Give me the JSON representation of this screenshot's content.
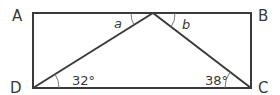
{
  "diagram": {
    "type": "geometry",
    "shape": "rectangle ABCD with point on AB joined to D and C",
    "vertices": {
      "A": {
        "label": "A",
        "x": 33,
        "y": 13
      },
      "B": {
        "label": "B",
        "x": 251,
        "y": 13
      },
      "C": {
        "label": "C",
        "x": 251,
        "y": 88
      },
      "D": {
        "label": "D",
        "x": 33,
        "y": 88
      },
      "P": {
        "label": "",
        "x": 153,
        "y": 13
      }
    },
    "angles": {
      "a": {
        "label": "a"
      },
      "b": {
        "label": "b"
      },
      "angle_D": {
        "label": "32°"
      },
      "angle_C": {
        "label": "38°"
      }
    },
    "colors": {
      "line": "#3a3a3a",
      "background": "#ffffff"
    }
  }
}
